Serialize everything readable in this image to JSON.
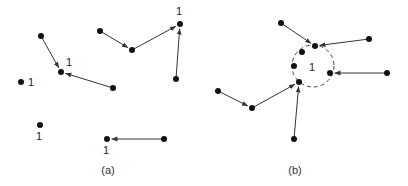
{
  "panels": [
    {
      "id": "a",
      "caption": "(a)",
      "caption_pos": [
        108,
        174
      ],
      "nodes": [
        {
          "id": "a1",
          "x": 41,
          "y": 36
        },
        {
          "id": "a2",
          "x": 61,
          "y": 72,
          "label": "1",
          "lx": 66,
          "ly": 66
        },
        {
          "id": "a3",
          "x": 113,
          "y": 88
        },
        {
          "id": "a4",
          "x": 21,
          "y": 82,
          "label": "1",
          "lx": 28,
          "ly": 86
        },
        {
          "id": "a5",
          "x": 100,
          "y": 31
        },
        {
          "id": "a6",
          "x": 132,
          "y": 50
        },
        {
          "id": "a7",
          "x": 180,
          "y": 24,
          "label": "1",
          "lx": 176,
          "ly": 15
        },
        {
          "id": "a8",
          "x": 176,
          "y": 79
        },
        {
          "id": "a9",
          "x": 40,
          "y": 125,
          "label": "1",
          "lx": 36,
          "ly": 140
        },
        {
          "id": "a10",
          "x": 107,
          "y": 139,
          "label": "1",
          "lx": 103,
          "ly": 154
        },
        {
          "id": "a11",
          "x": 164,
          "y": 139
        }
      ],
      "edges": [
        {
          "from": "a1",
          "to": "a2"
        },
        {
          "from": "a3",
          "to": "a2"
        },
        {
          "from": "a5",
          "to": "a6"
        },
        {
          "from": "a6",
          "to": "a7"
        },
        {
          "from": "a8",
          "to": "a7"
        },
        {
          "from": "a11",
          "to": "a10"
        }
      ]
    },
    {
      "id": "b",
      "caption": "(b)",
      "caption_pos": [
        295,
        174
      ],
      "cluster": {
        "cx": 313,
        "cy": 66,
        "r": 21,
        "label": "1",
        "lx": 309,
        "ly": 71
      },
      "nodes": [
        {
          "id": "b1",
          "x": 281,
          "y": 23
        },
        {
          "id": "b2",
          "x": 315,
          "y": 46
        },
        {
          "id": "b3",
          "x": 369,
          "y": 39
        },
        {
          "id": "b4",
          "x": 302,
          "y": 52
        },
        {
          "id": "b5",
          "x": 294,
          "y": 66
        },
        {
          "id": "b6",
          "x": 330,
          "y": 73
        },
        {
          "id": "b7",
          "x": 387,
          "y": 73
        },
        {
          "id": "b8",
          "x": 299,
          "y": 82
        },
        {
          "id": "b9",
          "x": 218,
          "y": 91
        },
        {
          "id": "b10",
          "x": 252,
          "y": 108
        },
        {
          "id": "b11",
          "x": 294,
          "y": 139
        }
      ],
      "edges": [
        {
          "from": "b1",
          "to": "b2"
        },
        {
          "from": "b3",
          "to": "b2"
        },
        {
          "from": "b7",
          "to": "b6"
        },
        {
          "from": "b9",
          "to": "b10"
        },
        {
          "from": "b10",
          "to": "b8"
        },
        {
          "from": "b11",
          "to": "b8"
        }
      ]
    }
  ],
  "style": {
    "node_color": "#111111",
    "edge_color": "#333333",
    "node_radius": 3
  }
}
